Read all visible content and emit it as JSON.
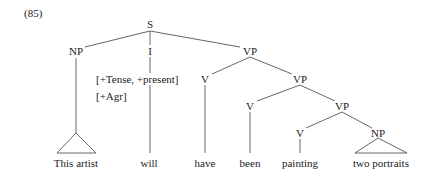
{
  "example_number": "(85)",
  "tree": {
    "S": "S",
    "NP_subject": "NP",
    "I": "I",
    "I_features_line1": "[+Tense, +present]",
    "I_features_line2": "[+Agr]",
    "VP1": "VP",
    "V1": "V",
    "VP2": "VP",
    "V2": "V",
    "VP3": "VP",
    "V3": "V",
    "NP_object": "NP"
  },
  "leaves": {
    "subject": "This artist",
    "aux_will": "will",
    "aux_have": "have",
    "aux_been": "been",
    "verb": "painting",
    "object": "two portraits"
  },
  "colors": {
    "line": "#555555",
    "text": "#222222"
  }
}
